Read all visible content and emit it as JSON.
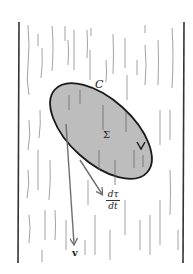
{
  "figure": {
    "labels": {
      "curve": "C",
      "surface": "Σ",
      "velocity": "v",
      "derivative_num": "dτ",
      "derivative_den": "dt"
    },
    "colors": {
      "surface_fill": "#bdbdbd",
      "curve_stroke": "#1a1a1a",
      "arrow_stroke": "#6e6e6e",
      "wall_stroke": "#333333",
      "streak_stroke": "#8a8a8a"
    }
  }
}
